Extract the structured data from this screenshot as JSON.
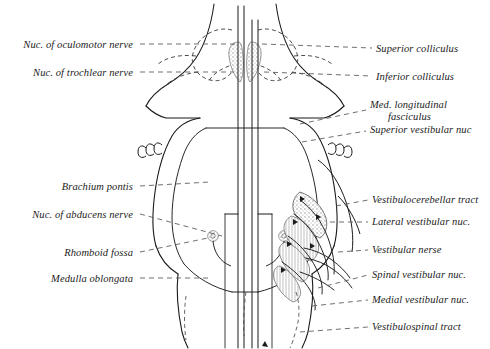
{
  "figure": {
    "stroke_color": "#1b1b1b",
    "leader_color": "#555555",
    "shade_color": "#9a9a9a",
    "background": "#ffffff"
  },
  "labels_left": [
    {
      "id": "nuc-oculomotor-nerve",
      "text": "Nuc. of oculomotor nerve",
      "x": 133,
      "y": 48
    },
    {
      "id": "nuc-trochlear-nerve",
      "text": "Nuc. of trochlear nerve",
      "x": 133,
      "y": 76
    },
    {
      "id": "brachium-pontis",
      "text": "Brachium pontis",
      "x": 133,
      "y": 190
    },
    {
      "id": "nuc-abducens-nerve",
      "text": "Nuc. of abducens nerve",
      "x": 133,
      "y": 218
    },
    {
      "id": "rhomboid-fossa",
      "text": "Rhomboid fossa",
      "x": 133,
      "y": 256
    },
    {
      "id": "medulla-oblongata",
      "text": "Medulla oblongata",
      "x": 133,
      "y": 282
    }
  ],
  "labels_right": [
    {
      "id": "superior-colliculus",
      "text": "Superior colliculus",
      "x": 376,
      "y": 52
    },
    {
      "id": "inferior-colliculus",
      "text": "Inferior colliculus",
      "x": 376,
      "y": 80
    },
    {
      "id": "med-longitudinal-fasciculus",
      "text": "Med. longitudinal",
      "text2": "fasciculus",
      "x": 370,
      "y": 108
    },
    {
      "id": "superior-vestibular-nuc",
      "text": "Superior vestibular nuc",
      "x": 370,
      "y": 133
    },
    {
      "id": "vestibulocerebellar-tract",
      "text": "Vestibulocerebellar tract",
      "x": 372,
      "y": 203
    },
    {
      "id": "lateral-vestibular-nuc",
      "text": "Lateral vestibular nuc.",
      "x": 372,
      "y": 225
    },
    {
      "id": "vestibular-nerve",
      "text": "Vestibular nerse",
      "x": 372,
      "y": 253
    },
    {
      "id": "spinal-vestibular-nuc",
      "text": "Spinal vestibular nuc.",
      "x": 372,
      "y": 278
    },
    {
      "id": "medial-vestibular-nuc",
      "text": "Medial vestibular nuc.",
      "x": 372,
      "y": 303
    },
    {
      "id": "vestibulospinal-tract",
      "text": "Vestibulospinal tract",
      "x": 372,
      "y": 330
    }
  ]
}
